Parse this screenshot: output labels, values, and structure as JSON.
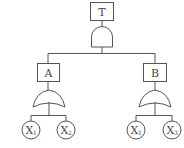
{
  "diagram": {
    "type": "fault-tree",
    "top_event": {
      "label": "T",
      "gate": "AND"
    },
    "intermediate_events": [
      {
        "label": "A",
        "gate": "OR",
        "inputs": [
          {
            "base": "X",
            "sub": "1"
          },
          {
            "base": "X",
            "sub": "2"
          }
        ]
      },
      {
        "label": "B",
        "gate": "OR",
        "inputs": [
          {
            "base": "X",
            "sub": "1"
          },
          {
            "base": "X",
            "sub": "3"
          }
        ]
      }
    ]
  },
  "labels": {
    "top": "T",
    "a": "A",
    "b": "B",
    "a_in1_base": "X",
    "a_in1_sub": "1",
    "a_in2_base": "X",
    "a_in2_sub": "2",
    "b_in1_base": "X",
    "b_in1_sub": "1",
    "b_in2_base": "X",
    "b_in2_sub": "3"
  }
}
